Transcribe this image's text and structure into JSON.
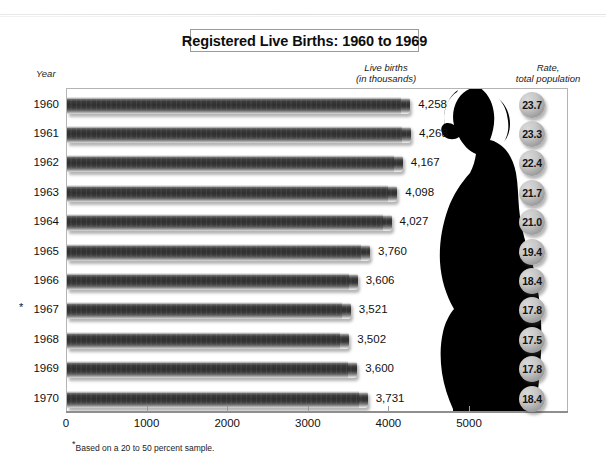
{
  "title": "Registered Live Births: 1960 to 1969",
  "headers": {
    "year": "Year",
    "births": "Live births\n(in thousands)",
    "rate": "Rate,\ntotal population"
  },
  "footnote_marker": "*",
  "footnote": "Based on a 20 to 50 percent sample.",
  "asterisk_year": "1967",
  "colors": {
    "bar_dark": "#2f2f2f",
    "bar_light": "#f4f4f4",
    "bubble": "#c7c7c7",
    "silhouette": "#000000",
    "frame": "#b4b4b4"
  },
  "chart_data": {
    "type": "bar",
    "title": "Registered Live Births: 1960 to 1969",
    "xlabel": "Live births (in thousands)",
    "ylabel": "Year",
    "orientation": "horizontal",
    "xlim": [
      0,
      5400
    ],
    "grid": false,
    "legend": null,
    "categories": [
      "1960",
      "1961",
      "1962",
      "1963",
      "1964",
      "1965",
      "1966",
      "1967",
      "1968",
      "1969",
      "1970"
    ],
    "values": [
      4258,
      4268,
      4167,
      4098,
      4027,
      3760,
      3606,
      3521,
      3502,
      3600,
      3731
    ],
    "value_labels": [
      "4,258",
      "4,268",
      "4,167",
      "4,098",
      "4,027",
      "3,760",
      "3,606",
      "3,521",
      "3,502",
      "3,600",
      "3,731"
    ],
    "xticks": [
      0,
      1000,
      2000,
      3000,
      4000,
      5000
    ],
    "xtick_labels": [
      "0",
      "1000",
      "2000",
      "3000",
      "4000",
      "5000"
    ],
    "secondary_series": {
      "name": "Rate, total population",
      "values": [
        23.7,
        23.3,
        22.4,
        21.7,
        21.0,
        19.4,
        18.4,
        17.8,
        17.5,
        17.8,
        18.4
      ],
      "labels": [
        "23.7",
        "23.3",
        "22.4",
        "21.7",
        "21.0",
        "19.4",
        "18.4",
        "17.8",
        "17.5",
        "17.8",
        "18.4"
      ]
    },
    "annotations": [
      "* Based on a 20 to 50 percent sample."
    ]
  }
}
